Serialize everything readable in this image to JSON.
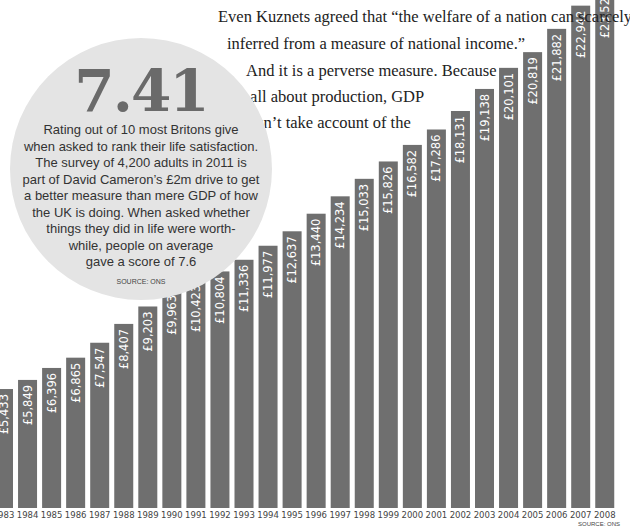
{
  "article": {
    "lines": [
      "Even Kuznets agreed that “the welfare of a nation can scarcely be",
      "inferred from a measure of national income.”",
      "And it is a perverse measure. Because",
      "it’s  all  about  production,  GDP",
      "doesn’t take account of the"
    ]
  },
  "callout": {
    "value": "7.41",
    "text_lines": [
      "Rating out of 10 most Britons give",
      "when asked to rank their life satisfaction.",
      "The survey of 4,200 adults in 2011 is",
      "part of David Cameron’s £2m drive to get",
      "a better measure than mere GDP of how",
      "the UK is doing. When asked whether",
      "things they did in life were worth-",
      "while, people on average",
      "gave a score of 7.6"
    ],
    "source": "SOURCE: ONS",
    "background_color": "#e4e4e4"
  },
  "chart_data": {
    "type": "bar",
    "title": "",
    "xlabel": "",
    "ylabel": "",
    "categories": [
      "1983",
      "1984",
      "1985",
      "1986",
      "1987",
      "1988",
      "1989",
      "1990",
      "1991",
      "1992",
      "1993",
      "1994",
      "1995",
      "1996",
      "1997",
      "1998",
      "1999",
      "2000",
      "2001",
      "2002",
      "2003",
      "2004",
      "2005",
      "2006",
      "2007",
      "2008"
    ],
    "values": [
      5433,
      5849,
      6396,
      6865,
      7547,
      8407,
      9203,
      9963,
      10423,
      10804,
      11336,
      11977,
      12637,
      13440,
      14234,
      15033,
      15826,
      16582,
      17286,
      18131,
      19138,
      20101,
      20819,
      21882,
      22942,
      23520
    ],
    "data_labels": [
      "£5,433",
      "£5,849",
      "£6,396",
      "£6,865",
      "£7,547",
      "£8,407",
      "£9,203",
      "£9,963",
      "£10,423",
      "£10,804",
      "£11,336",
      "£11,977",
      "£12,637",
      "£13,440",
      "£14,234",
      "£15,033",
      "£15,826",
      "£16,582",
      "£17,286",
      "£18,131",
      "£19,138",
      "£20,101",
      "£20,819",
      "£21,882",
      "£22,942",
      "£23,52"
    ],
    "ylim": [
      0,
      23200
    ],
    "grid": false,
    "bar_color": "#6f6f6f",
    "source": "SOURCE: ONS"
  }
}
